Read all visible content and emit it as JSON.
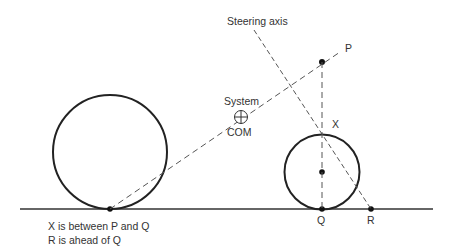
{
  "diagram": {
    "labels": {
      "steering_axis": "Steering axis",
      "P": "P",
      "X": "X",
      "Q": "Q",
      "R": "R",
      "system": "System",
      "com": "COM"
    },
    "notes": [
      "X is between P and Q",
      "R is ahead of Q"
    ],
    "colors": {
      "line": "#222222",
      "dashed": "#555555",
      "text": "#333333"
    }
  }
}
